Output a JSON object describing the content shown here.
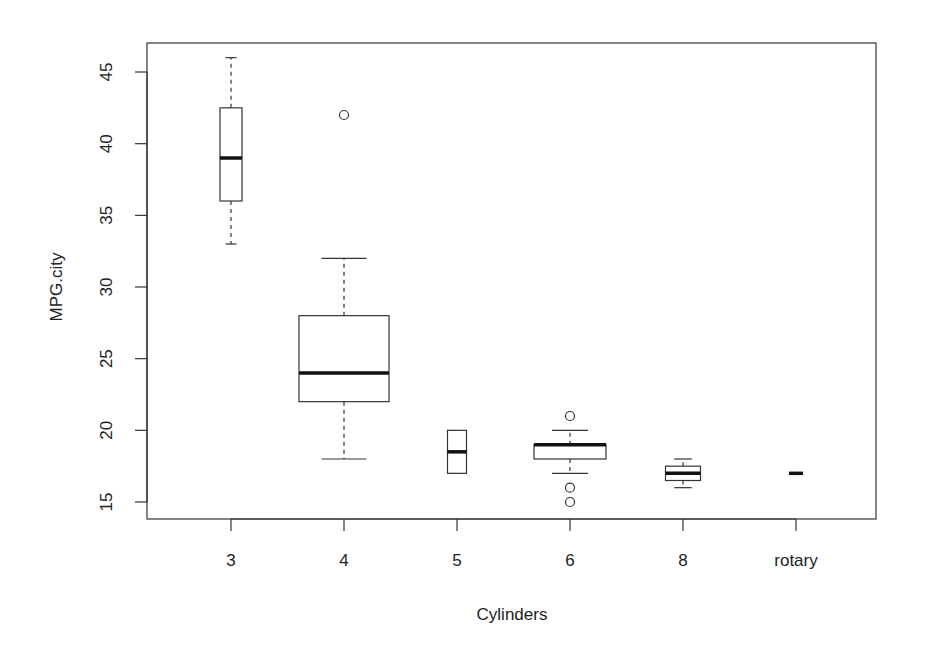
{
  "chart_data": {
    "type": "boxplot",
    "title": "",
    "xlabel": "Cylinders",
    "ylabel": "MPG.city",
    "categories": [
      "3",
      "4",
      "5",
      "6",
      "8",
      "rotary"
    ],
    "ylim": [
      14,
      47
    ],
    "yticks": [
      15,
      20,
      25,
      30,
      35,
      40,
      45
    ],
    "grid": false,
    "legend": null,
    "variable_width": true,
    "boxes": [
      {
        "category": "3",
        "whisker_low": 33,
        "q1": 36,
        "median": 39,
        "q3": 42.5,
        "whisker_high": 46,
        "outliers": [],
        "width": 22
      },
      {
        "category": "4",
        "whisker_low": 18,
        "q1": 22,
        "median": 24,
        "q3": 28,
        "whisker_high": 32,
        "outliers": [
          42
        ],
        "width": 90
      },
      {
        "category": "5",
        "whisker_low": 17,
        "q1": 17,
        "median": 18.5,
        "q3": 20,
        "whisker_high": 20,
        "outliers": [],
        "width": 19
      },
      {
        "category": "6",
        "whisker_low": 17,
        "q1": 18,
        "median": 19,
        "q3": 19,
        "whisker_high": 20,
        "outliers": [
          21,
          16,
          15
        ],
        "width": 72
      },
      {
        "category": "8",
        "whisker_low": 16,
        "q1": 16.5,
        "median": 17,
        "q3": 17.5,
        "whisker_high": 18,
        "outliers": [],
        "width": 35
      },
      {
        "category": "rotary",
        "whisker_low": 17,
        "q1": 17,
        "median": 17,
        "q3": 17,
        "whisker_high": 17,
        "outliers": [],
        "width": 14
      }
    ]
  },
  "colors": {
    "line": "#333333",
    "median": "#111111",
    "background": "#ffffff"
  }
}
